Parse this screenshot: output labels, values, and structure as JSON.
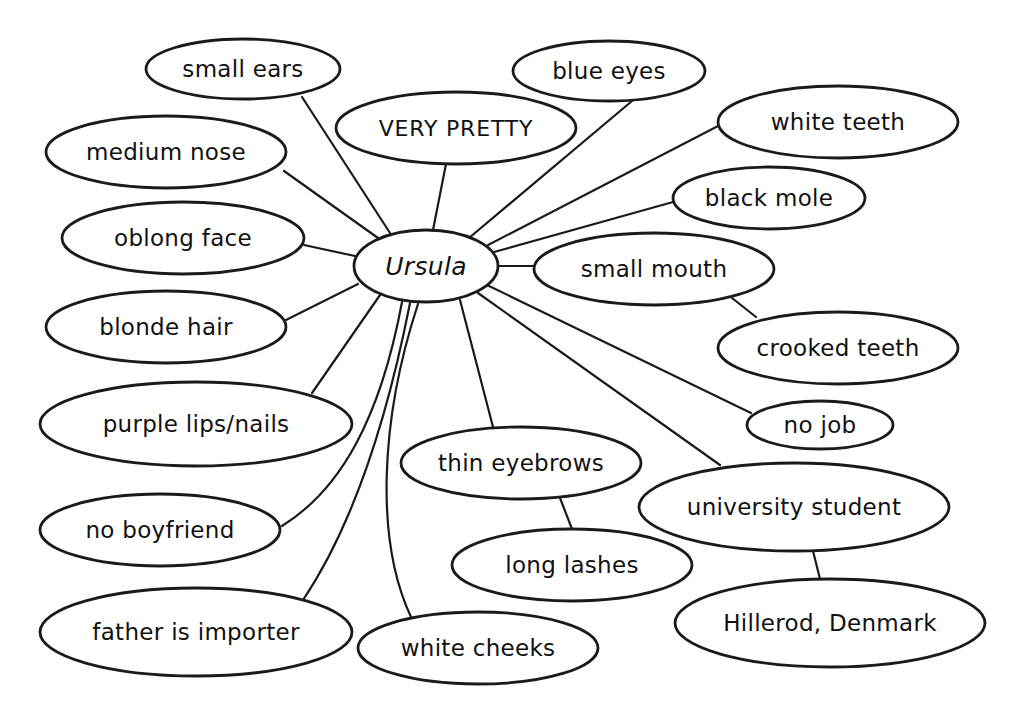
{
  "diagram": {
    "type": "concept-web",
    "background": "#ffffff",
    "stroke_color": "#1a1a1a",
    "center": {
      "id": "ursula",
      "label": "Ursula",
      "cx": 426,
      "cy": 266,
      "rx": 72,
      "ry": 36
    },
    "nodes": [
      {
        "id": "small-ears",
        "label": "small ears",
        "cx": 243,
        "cy": 69,
        "rx": 97,
        "ry": 30
      },
      {
        "id": "very-pretty",
        "label": "VERY PRETTY",
        "cx": 456,
        "cy": 128,
        "rx": 120,
        "ry": 36,
        "style": "caps"
      },
      {
        "id": "blue-eyes",
        "label": "blue eyes",
        "cx": 609,
        "cy": 71,
        "rx": 96,
        "ry": 30
      },
      {
        "id": "white-teeth",
        "label": "white teeth",
        "cx": 838,
        "cy": 122,
        "rx": 120,
        "ry": 36
      },
      {
        "id": "black-mole",
        "label": "black mole",
        "cx": 769,
        "cy": 198,
        "rx": 96,
        "ry": 31
      },
      {
        "id": "medium-nose",
        "label": "medium nose",
        "cx": 166,
        "cy": 152,
        "rx": 120,
        "ry": 36
      },
      {
        "id": "oblong-face",
        "label": "oblong face",
        "cx": 183,
        "cy": 238,
        "rx": 121,
        "ry": 36
      },
      {
        "id": "small-mouth",
        "label": "small mouth",
        "cx": 654,
        "cy": 269,
        "rx": 120,
        "ry": 36
      },
      {
        "id": "blonde-hair",
        "label": "blonde hair",
        "cx": 166,
        "cy": 327,
        "rx": 120,
        "ry": 36
      },
      {
        "id": "crooked-teeth",
        "label": "crooked teeth",
        "cx": 838,
        "cy": 348,
        "rx": 120,
        "ry": 36
      },
      {
        "id": "purple-lips-nails",
        "label": "purple lips/nails",
        "cx": 196,
        "cy": 424,
        "rx": 156,
        "ry": 42
      },
      {
        "id": "no-job",
        "label": "no job",
        "cx": 820,
        "cy": 425,
        "rx": 73,
        "ry": 24
      },
      {
        "id": "thin-eyebrows",
        "label": "thin eyebrows",
        "cx": 521,
        "cy": 463,
        "rx": 120,
        "ry": 36
      },
      {
        "id": "university-student",
        "label": "university student",
        "cx": 794,
        "cy": 507,
        "rx": 155,
        "ry": 44
      },
      {
        "id": "no-boyfriend",
        "label": "no boyfriend",
        "cx": 160,
        "cy": 530,
        "rx": 120,
        "ry": 36
      },
      {
        "id": "long-lashes",
        "label": "long lashes",
        "cx": 572,
        "cy": 565,
        "rx": 120,
        "ry": 36
      },
      {
        "id": "father-is-importer",
        "label": "father is importer",
        "cx": 196,
        "cy": 632,
        "rx": 156,
        "ry": 44
      },
      {
        "id": "white-cheeks",
        "label": "white cheeks",
        "cx": 478,
        "cy": 648,
        "rx": 120,
        "ry": 36
      },
      {
        "id": "hillerod-denmark",
        "label": "Hillerod, Denmark",
        "cx": 830,
        "cy": 623,
        "rx": 155,
        "ry": 44
      }
    ],
    "edges": [
      {
        "from": "ursula",
        "to": "small-ears",
        "path": "M390 233 L302 97"
      },
      {
        "from": "ursula",
        "to": "very-pretty",
        "path": "M433 230 L446 164"
      },
      {
        "from": "ursula",
        "to": "blue-eyes",
        "path": "M469 238 L632 101"
      },
      {
        "from": "ursula",
        "to": "white-teeth",
        "path": "M488 245 L720 125"
      },
      {
        "from": "ursula",
        "to": "black-mole",
        "path": "M494 252 L673 202"
      },
      {
        "from": "ursula",
        "to": "medium-nose",
        "path": "M378 238 L284 171"
      },
      {
        "from": "ursula",
        "to": "oblong-face",
        "path": "M355 256 L304 245"
      },
      {
        "from": "ursula",
        "to": "small-mouth",
        "path": "M498 266 L534 266"
      },
      {
        "from": "ursula",
        "to": "blonde-hair",
        "path": "M358 284 L286 320"
      },
      {
        "from": "small-mouth",
        "to": "crooked-teeth",
        "path": "M732 298 L756 317"
      },
      {
        "from": "ursula",
        "to": "purple-lips-nails",
        "path": "M380 295 L312 393"
      },
      {
        "from": "ursula",
        "to": "no-job",
        "path": "M487 285 L751 413"
      },
      {
        "from": "ursula",
        "to": "thin-eyebrows",
        "path": "M460 300 L493 427"
      },
      {
        "from": "ursula",
        "to": "university-student",
        "path": "M478 293 L720 465"
      },
      {
        "from": "ursula",
        "to": "no-boyfriend",
        "path": "M402 302 C 380 420, 340 490, 282 526"
      },
      {
        "from": "thin-eyebrows",
        "to": "long-lashes",
        "path": "M560 498 L572 529"
      },
      {
        "from": "ursula",
        "to": "father-is-importer",
        "path": "M410 303 C 385 430, 350 530, 303 600"
      },
      {
        "from": "ursula",
        "to": "white-cheeks",
        "path": "M418 304 C 380 420, 375 540, 411 617"
      },
      {
        "from": "university-student",
        "to": "hillerod-denmark",
        "path": "M813 551 L820 579"
      }
    ]
  }
}
